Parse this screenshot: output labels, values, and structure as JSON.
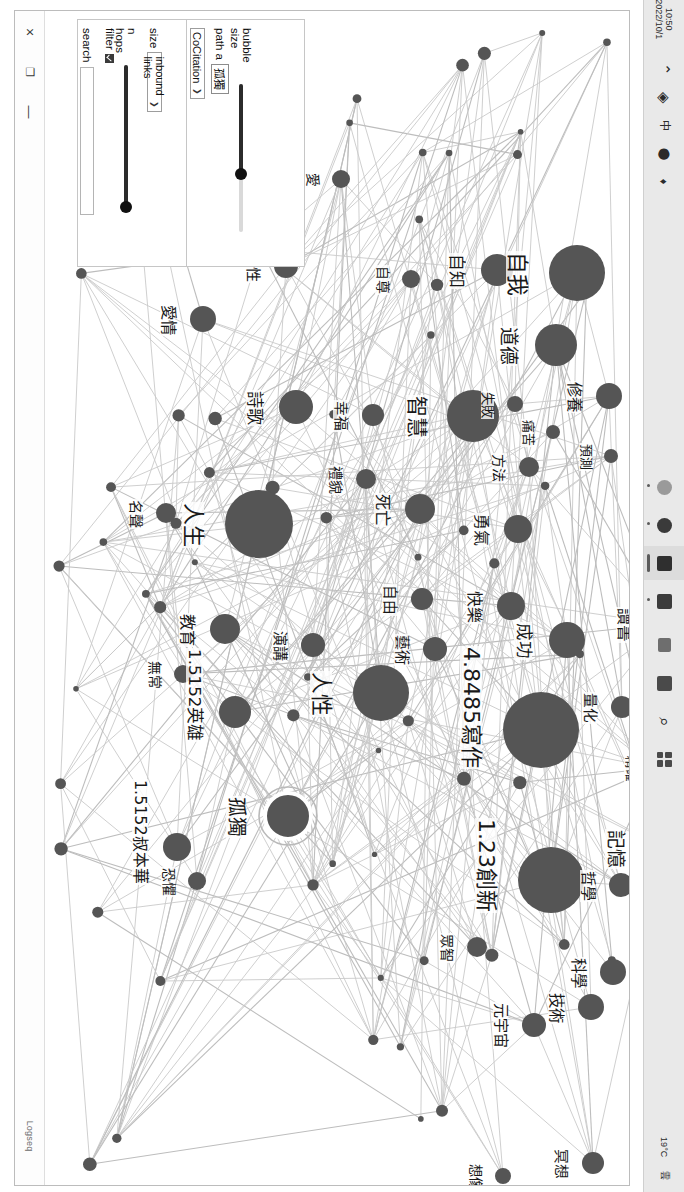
{
  "window": {
    "app_title": "Logseq",
    "controls": {
      "close": "×",
      "maximize": "❐",
      "minimize": "—"
    }
  },
  "panel": {
    "search_label": "search",
    "search_value": "",
    "search_placeholder": "",
    "filter_label": "filter",
    "filter_checked": true,
    "nhops_label": "n hops",
    "nhops_value": 100,
    "size_label": "size",
    "size_value": "inbound links",
    "mode_value": "CoCitation",
    "path_label": "path a",
    "path_value": "孤獨",
    "bubble_label": "bubble size",
    "bubble_value": 62,
    "caret": "❯"
  },
  "taskbar": {
    "clock_time": "10:50",
    "clock_date": "2022/10/1",
    "tray": [
      "⌃",
      "◈",
      "中",
      "⬤",
      "♦"
    ],
    "search_icon": "⌕",
    "items": [
      "start-grid",
      "search",
      "file-explorer",
      "app-blue",
      "app-teal",
      "app-red",
      "app-green",
      "app-grey"
    ],
    "weather": "19°C",
    "weather_label": "雲"
  },
  "graph": {
    "highlighted_node": "孤獨",
    "nodes": [
      {
        "label": "自我",
        "x": 532,
        "y": 262,
        "r": 28
      },
      {
        "label": "自知",
        "x": 452,
        "y": 259,
        "r": 16
      },
      {
        "label": "道德",
        "x": 511,
        "y": 334,
        "r": 21
      },
      {
        "label": "修養",
        "x": 564,
        "y": 385,
        "r": 13
      },
      {
        "label": "智慧",
        "x": 428,
        "y": 405,
        "r": 26
      },
      {
        "label": "失敗",
        "x": 470,
        "y": 393,
        "r": 8
      },
      {
        "label": "痛苦",
        "x": 508,
        "y": 421,
        "r": 7
      },
      {
        "label": "方法",
        "x": 484,
        "y": 456,
        "r": 10
      },
      {
        "label": "勇氣",
        "x": 473,
        "y": 518,
        "r": 14
      },
      {
        "label": "預測",
        "x": 566,
        "y": 445,
        "r": 7
      },
      {
        "label": "愛",
        "x": 296,
        "y": 168,
        "r": 9
      },
      {
        "label": "女性",
        "x": 241,
        "y": 255,
        "r": 12
      },
      {
        "label": "自尊",
        "x": 366,
        "y": 268,
        "r": 9
      },
      {
        "label": "愛情",
        "x": 158,
        "y": 308,
        "r": 13
      },
      {
        "label": "詩歌",
        "x": 251,
        "y": 396,
        "r": 17
      },
      {
        "label": "幸福",
        "x": 328,
        "y": 404,
        "r": 11
      },
      {
        "label": "禮貌",
        "x": 321,
        "y": 468,
        "r": 10
      },
      {
        "label": "名聲",
        "x": 121,
        "y": 502,
        "r": 10
      },
      {
        "label": "人生",
        "x": 214,
        "y": 513,
        "r": 34
      },
      {
        "label": "死亡",
        "x": 375,
        "y": 498,
        "r": 15
      },
      {
        "label": "自由",
        "x": 377,
        "y": 588,
        "r": 11
      },
      {
        "label": "藝術",
        "x": 390,
        "y": 638,
        "r": 12
      },
      {
        "label": "人性",
        "x": 336,
        "y": 682,
        "r": 28
      },
      {
        "label": "快樂",
        "x": 466,
        "y": 595,
        "r": 14
      },
      {
        "label": "成功",
        "x": 522,
        "y": 629,
        "r": 18
      },
      {
        "label": "讀書",
        "x": 620,
        "y": 613,
        "r": 16
      },
      {
        "label": "量化",
        "x": 577,
        "y": 696,
        "r": 11
      },
      {
        "label": "寫作",
        "x": 496,
        "y": 719,
        "r": 38
      },
      {
        "label": "精確",
        "x": 610,
        "y": 757,
        "r": 6
      },
      {
        "label": "記憶",
        "x": 618,
        "y": 837,
        "r": 21
      },
      {
        "label": "創新",
        "x": 506,
        "y": 869,
        "r": 33
      },
      {
        "label": "哲學",
        "x": 576,
        "y": 874,
        "r": 12
      },
      {
        "label": "科學",
        "x": 568,
        "y": 961,
        "r": 13
      },
      {
        "label": "技術",
        "x": 546,
        "y": 996,
        "r": 13
      },
      {
        "label": "元宇宙",
        "x": 489,
        "y": 1014,
        "r": 12
      },
      {
        "label": "眾智",
        "x": 432,
        "y": 936,
        "r": 10
      },
      {
        "label": "想像",
        "x": 458,
        "y": 1165,
        "r": 8
      },
      {
        "label": "冥想",
        "x": 548,
        "y": 1152,
        "r": 11
      },
      {
        "label": "無常",
        "x": 138,
        "y": 663,
        "r": 9
      },
      {
        "label": "叔本華",
        "x": 132,
        "y": 836,
        "r": 14
      },
      {
        "label": "英雄",
        "x": 190,
        "y": 701,
        "r": 16
      },
      {
        "label": "教育",
        "x": 180,
        "y": 618,
        "r": 15
      },
      {
        "label": "演講",
        "x": 268,
        "y": 634,
        "r": 12
      },
      {
        "label": "恐懼",
        "x": 152,
        "y": 870,
        "r": 9
      },
      {
        "label": "孤獨",
        "x": 243,
        "y": 805,
        "r": 23
      }
    ],
    "value_labels": [
      {
        "text": "1.5152",
        "node": "叔本華"
      },
      {
        "text": "1.5152",
        "node": "英雄"
      },
      {
        "text": "4.8485",
        "node": "寫作"
      },
      {
        "text": "1.23",
        "node": "創新"
      }
    ]
  }
}
